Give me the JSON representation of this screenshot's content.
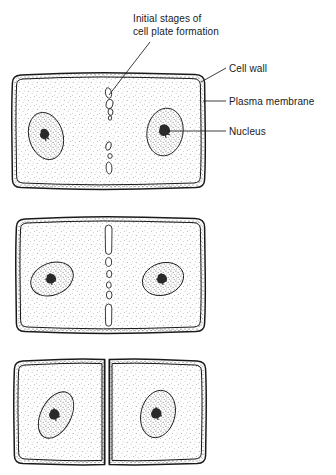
{
  "figure": {
    "title_label": "Initial stages of\ncell plate formation",
    "labels": {
      "cell_wall": "Cell wall",
      "plasma_membrane": "Plasma membrane",
      "nucleus": "Nucleus"
    },
    "colors": {
      "ink": "#1a1a1a",
      "stipple": "#5d5d5d",
      "background": "#ffffff",
      "nucleolus": "#2a2a2a"
    },
    "panels": [
      {
        "stage": 1,
        "description": "Cell with two nuclei and small vesicles aligned along the midline beginning cell plate formation",
        "nuclei": 2,
        "midline_elements": "scattered small vesicles"
      },
      {
        "stage": 2,
        "description": "Cell plate further developed with elongated spindle segments at top and bottom and round vesicles between",
        "nuclei": 2,
        "midline_elements": "elongated segments and vesicles"
      },
      {
        "stage": 3,
        "description": "Two separate daughter cells each with one nucleus divided by a complete new cell wall",
        "nuclei": 2,
        "midline_elements": "complete dividing wall"
      }
    ]
  }
}
